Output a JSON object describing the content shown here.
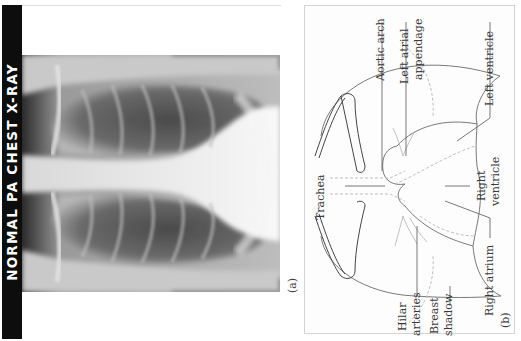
{
  "figure": {
    "title": "NORMAL PA CHEST X-RAY",
    "panel_a": {
      "label": "(a)",
      "content": "Posteroanterior chest radiograph"
    },
    "panel_b": {
      "label": "(b)",
      "annotations": {
        "aortic_arch": "Aortic arch",
        "left_atrial_appendage_1": "Left atrial",
        "left_atrial_appendage_2": "appendage",
        "left_ventricle": "Left ventricle",
        "trachea": "Trachea",
        "right_ventricle_1": "Right",
        "right_ventricle_2": "ventricle",
        "right_atrium": "Right atrium",
        "hilar_arteries_1": "Hilar",
        "hilar_arteries_2": "arteries",
        "breast_shadow_1": "Breast",
        "breast_shadow_2": "shadow"
      }
    },
    "colors": {
      "title_bar": "#0d0d0d",
      "title_text": "#ffffff",
      "line": "#6a6a6a",
      "dashed": "#b8b8b8",
      "panel_border": "#d4d4d4"
    }
  }
}
